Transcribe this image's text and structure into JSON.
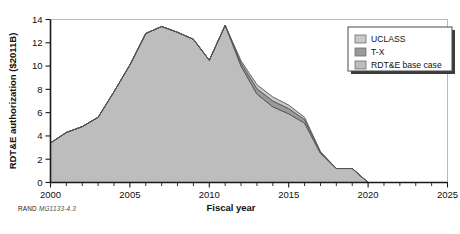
{
  "figure": {
    "caption_prefix": "RAND",
    "caption_id": "MG1133-4.3"
  },
  "legend": {
    "position": "top-right",
    "items": [
      {
        "label": "UCLASS",
        "color": "#c9c9c9"
      },
      {
        "label": "T-X",
        "color": "#9a9a9a"
      },
      {
        "label": "RDT&E base case",
        "color": "#bdbdbd"
      }
    ]
  },
  "chart_data": {
    "type": "area",
    "stacked": true,
    "title": "",
    "xlabel": "Fiscal year",
    "ylabel": "RDT&E authorization ($2011B)",
    "xlim": [
      2000,
      2025
    ],
    "ylim": [
      0,
      14
    ],
    "xticks": [
      2000,
      2005,
      2010,
      2015,
      2020,
      2025
    ],
    "xtick_labels": [
      "2000",
      "2005",
      "2010",
      "2015",
      "2020",
      "2025"
    ],
    "xminor_step": 1,
    "yticks": [
      0,
      2,
      4,
      6,
      8,
      10,
      12,
      14
    ],
    "ytick_labels": [
      "0",
      "2",
      "4",
      "6",
      "8",
      "10",
      "12",
      "14"
    ],
    "grid": false,
    "x": [
      2000,
      2001,
      2002,
      2003,
      2004,
      2005,
      2006,
      2007,
      2008,
      2009,
      2010,
      2011,
      2012,
      2013,
      2014,
      2015,
      2016,
      2017,
      2018,
      2019,
      2020,
      2021,
      2022,
      2023,
      2024,
      2025
    ],
    "series": [
      {
        "name": "RDT&E base case",
        "color": "#bdbdbd",
        "values": [
          3.4,
          4.3,
          4.8,
          5.6,
          7.8,
          10.1,
          12.8,
          13.4,
          12.9,
          12.3,
          10.5,
          13.5,
          10.0,
          7.6,
          6.5,
          5.9,
          5.1,
          2.5,
          1.2,
          1.2,
          0.0,
          0.0,
          0.0,
          0.0,
          0.0,
          0.0
        ]
      },
      {
        "name": "T-X",
        "color": "#9a9a9a",
        "values": [
          0.0,
          0.0,
          0.0,
          0.0,
          0.0,
          0.0,
          0.0,
          0.0,
          0.0,
          0.0,
          0.0,
          0.0,
          0.25,
          0.45,
          0.5,
          0.45,
          0.3,
          0.1,
          0.0,
          0.0,
          0.0,
          0.0,
          0.0,
          0.0,
          0.0,
          0.0
        ]
      },
      {
        "name": "UCLASS",
        "color": "#c9c9c9",
        "values": [
          0.0,
          0.0,
          0.0,
          0.0,
          0.0,
          0.0,
          0.0,
          0.0,
          0.0,
          0.0,
          0.0,
          0.0,
          0.2,
          0.35,
          0.35,
          0.3,
          0.2,
          0.05,
          0.0,
          0.0,
          0.0,
          0.0,
          0.0,
          0.0,
          0.0,
          0.0
        ]
      }
    ]
  }
}
